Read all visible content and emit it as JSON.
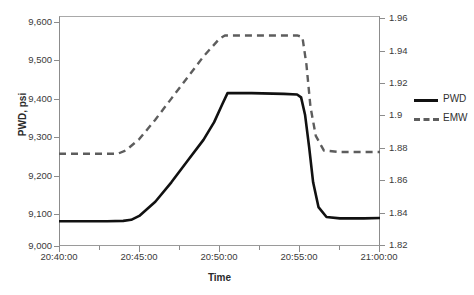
{
  "chart_data": {
    "type": "line",
    "title": "",
    "xlabel": "Time",
    "ylabel": "PWD, psi",
    "y2label": "",
    "grid": false,
    "legend_position": "right",
    "xtick_labels": [
      "20:40:00",
      "20:45:00",
      "20:50:00",
      "20:55:00",
      "21:00:00"
    ],
    "x_minor_ticks_between": 1,
    "ylim": [
      9000,
      9650
    ],
    "ytick_labels": [
      "9,000",
      "9,100",
      "9,200",
      "9,300",
      "9,400",
      "9,500",
      "9,600"
    ],
    "ytick_values": [
      9000,
      9100,
      9200,
      9300,
      9400,
      9500,
      9600
    ],
    "y2lim": [
      1.82,
      1.962
    ],
    "y2tick_labels": [
      "1.82",
      "1.84",
      "1.86",
      "1.88",
      "1.9",
      "1.92",
      "1.94",
      "1.96"
    ],
    "y2tick_values": [
      1.82,
      1.84,
      1.86,
      1.88,
      1.9,
      1.92,
      1.94,
      1.96
    ],
    "series": [
      {
        "name": "PWD",
        "axis": "left",
        "style": "solid",
        "color": "#111111",
        "x": [
          "20:40:00",
          "20:43:00",
          "20:44:00",
          "20:44:30",
          "20:45:00",
          "20:46:00",
          "20:47:00",
          "20:48:00",
          "20:49:00",
          "20:49:40",
          "20:50:10",
          "20:50:30",
          "20:52:00",
          "20:54:00",
          "20:54:50",
          "20:55:05",
          "20:55:20",
          "20:55:35",
          "20:55:50",
          "20:56:10",
          "20:56:40",
          "20:57:30",
          "20:59:00",
          "21:00:00"
        ],
        "y": [
          9070,
          9070,
          9071,
          9074,
          9085,
          9125,
          9180,
          9240,
          9300,
          9350,
          9400,
          9432,
          9432,
          9430,
          9428,
          9420,
          9370,
          9280,
          9180,
          9110,
          9082,
          9078,
          9078,
          9079
        ]
      },
      {
        "name": "EMW",
        "axis": "right",
        "style": "dashed",
        "color": "#5d5d5d",
        "x": [
          "20:40:00",
          "20:43:00",
          "20:43:40",
          "20:44:10",
          "20:45:00",
          "20:46:00",
          "20:47:00",
          "20:48:00",
          "20:49:00",
          "20:50:00",
          "20:50:20",
          "20:52:00",
          "20:54:00",
          "20:54:50",
          "20:55:10",
          "20:55:25",
          "20:55:40",
          "20:56:00",
          "20:56:30",
          "20:57:30",
          "20:59:00",
          "21:00:00"
        ],
        "y": [
          1.877,
          1.877,
          1.877,
          1.879,
          1.886,
          1.898,
          1.911,
          1.924,
          1.937,
          1.948,
          1.95,
          1.95,
          1.95,
          1.95,
          1.949,
          1.932,
          1.906,
          1.888,
          1.879,
          1.878,
          1.878,
          1.878
        ]
      }
    ],
    "annotations": []
  },
  "axes": {
    "y_left": {
      "title": "PWD, psi",
      "ticks": [
        "9,600",
        "9,500",
        "9,400",
        "9,300",
        "9,200",
        "9,100",
        "9,000"
      ]
    },
    "y_right": {
      "title": "",
      "ticks": [
        "1.96",
        "1.94",
        "1.92",
        "1.9",
        "1.88",
        "1.86",
        "1.84",
        "1.82"
      ]
    },
    "x_bottom": {
      "title": "Time",
      "ticks": [
        "20:40:00",
        "20:45:00",
        "20:50:00",
        "20:55:00",
        "21:00:00"
      ]
    }
  },
  "legend": {
    "items": [
      {
        "label": "PWD",
        "style": "solid",
        "color": "#111111"
      },
      {
        "label": "EMW",
        "style": "dashed",
        "color": "#5d5d5d"
      }
    ]
  },
  "colors": {
    "pwd_line": "#111111",
    "emw_line": "#5d5d5d",
    "frame": "#8c8c8c",
    "text": "#2f2f2f",
    "background": "#ffffff"
  }
}
